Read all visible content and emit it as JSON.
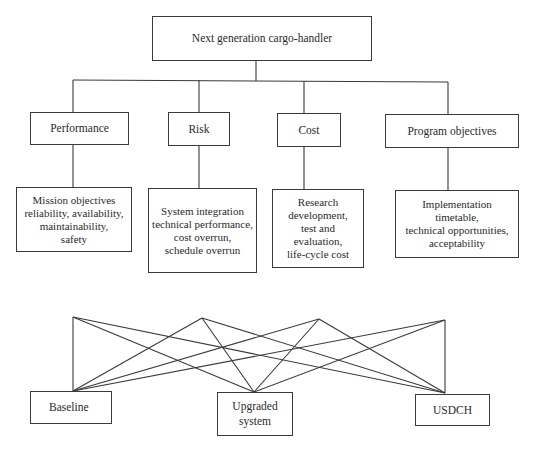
{
  "goal": {
    "label": "Next generation cargo-handler"
  },
  "criteria": [
    {
      "label": "Performance"
    },
    {
      "label": "Risk"
    },
    {
      "label": "Cost"
    },
    {
      "label": "Program objectives"
    }
  ],
  "subcriteria": [
    {
      "label": "Mission objectives\nreliability, availability,\nmaintainability,\nsafety"
    },
    {
      "label": "System integration\ntechnical performance,\ncost overrun,\nschedule overrun"
    },
    {
      "label": "Research\ndevelopment,\ntest and\nevaluation,\nlife-cycle cost"
    },
    {
      "label": "Implementation\ntimetable,\ntechnical opportunities,\nacceptability"
    }
  ],
  "alternatives": [
    {
      "label": "Baseline"
    },
    {
      "label": "Upgraded\nsystem"
    },
    {
      "label": "USDCH"
    }
  ],
  "colors": {
    "line": "#3a3a3a",
    "background": "#ffffff",
    "text": "#2a2a2a"
  }
}
